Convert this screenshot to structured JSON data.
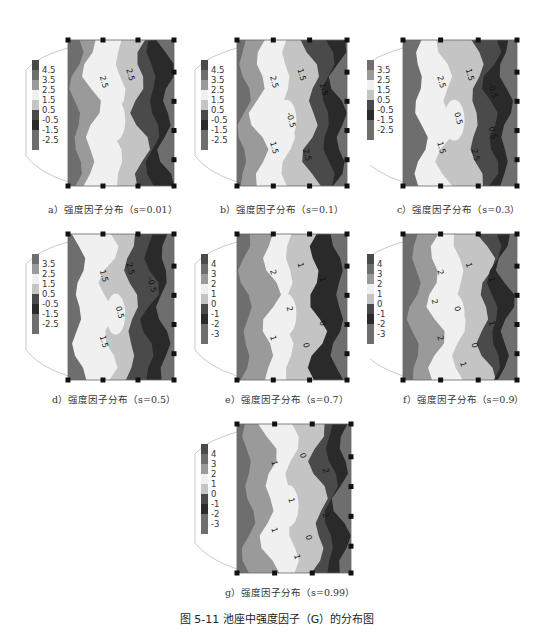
{
  "figure": {
    "title": "图 5-11   池座中强度因子（G）的分布图",
    "colors": {
      "darkest": "#2a2a2a",
      "dark": "#4a4a4a",
      "mid_dark": "#6e6e6e",
      "mid": "#9a9a9a",
      "light": "#c4c4c4",
      "lighter": "#dedede",
      "lightest": "#f0f0f0"
    }
  },
  "chart_data": [
    {
      "type": "heatmap",
      "panel": "a",
      "caption": "a）强度因子分布（s=0.01）",
      "legend_ticks": [
        "4.5",
        "3.5",
        "2.5",
        "1.5",
        "0.5",
        "-0.5",
        "-1.5",
        "-2.5"
      ],
      "contour_labels": [
        "2.5",
        "2.5"
      ],
      "pattern": "high values (1.5–2.5) in center-left band; low values (-1.5 to -2.5) in right band"
    },
    {
      "type": "heatmap",
      "panel": "b",
      "caption": "b）强度因子分布（s=0.1）",
      "legend_ticks": [
        "4.5",
        "3.5",
        "2.5",
        "1.5",
        "0.5",
        "-0.5",
        "-1.5",
        "-2.5"
      ],
      "contour_labels": [
        "2.5",
        "1.5",
        "1.5",
        "-0.5",
        "1.5",
        "2.5"
      ],
      "pattern": "light center band 1.5–2.5; dark right band below -0.5"
    },
    {
      "type": "heatmap",
      "panel": "c",
      "caption": "c）强度因子分布（s=0.3）",
      "legend_ticks": [
        "3.5",
        "2.5",
        "1.5",
        "0.5",
        "-0.5",
        "-1.5",
        "-2.5"
      ],
      "contour_labels": [
        "2.5",
        "1.5",
        "-0.5",
        "0.5",
        "1.5",
        "2.5",
        "0.5"
      ],
      "pattern": "light center band; dark right band"
    },
    {
      "type": "heatmap",
      "panel": "d",
      "caption": "d）强度因子分布（s=0.5）",
      "legend_ticks": [
        "3.5",
        "2.5",
        "1.5",
        "0.5",
        "-0.5",
        "-1.5",
        "-2.5"
      ],
      "contour_labels": [
        "1.5",
        "2.5",
        "-0.5",
        "0.5",
        "1.5"
      ],
      "pattern": "light center band; dark right band"
    },
    {
      "type": "heatmap",
      "panel": "e",
      "caption": "e）强度因子分布（s=0.7）",
      "legend_ticks": [
        "4",
        "3",
        "2",
        "1",
        "0",
        "-1",
        "-2",
        "-3"
      ],
      "contour_labels": [
        "2",
        "1",
        "1",
        "2",
        "1",
        "0",
        "0"
      ],
      "pattern": "light center band around 2; darkest right band near -1"
    },
    {
      "type": "heatmap",
      "panel": "f",
      "caption": "f）强度因子分布（s=0.9）",
      "legend_ticks": [
        "4",
        "3",
        "2",
        "1",
        "0",
        "-1",
        "-2",
        "-3"
      ],
      "contour_labels": [
        "2",
        "1",
        "1",
        "0",
        "2",
        "0",
        "1",
        "1",
        "2"
      ],
      "pattern": "light center band; dark right band"
    },
    {
      "type": "heatmap",
      "panel": "g",
      "caption": "g）强度因子分布（s=0.99）",
      "legend_ticks": [
        "4",
        "3",
        "2",
        "1",
        "0",
        "-1",
        "-2",
        "-3"
      ],
      "contour_labels": [
        "1",
        "0",
        "2",
        "1",
        "1",
        "0",
        "2",
        "1"
      ],
      "pattern": "light center band; dark right band"
    }
  ]
}
